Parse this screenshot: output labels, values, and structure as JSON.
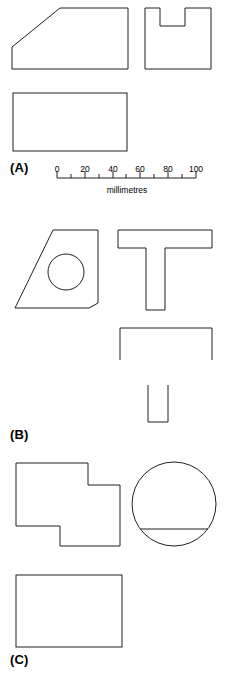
{
  "figure": {
    "background_color": "#ffffff",
    "line_color": "#231f20",
    "line_width": 1
  },
  "groups": [
    {
      "key": "A",
      "label": "(A)",
      "label_position": {
        "x": 10,
        "y": 160
      },
      "views": [
        {
          "name": "wedge-front-view",
          "shape": "polygon",
          "description": "right-angled wedge / ramp block",
          "points": "12,69 12,47 60,8 128,8 128,69"
        },
        {
          "name": "slotted-block-side-view",
          "shape": "polygon",
          "description": "square block with central rectangular slot open at top",
          "points": "145,69 145,8 160,8 160,26 185,26 185,8 211,8 211,69"
        },
        {
          "name": "base-rectangle-plan-view",
          "shape": "rect",
          "description": "plain rectangle plan view",
          "x": 13,
          "y": 93,
          "width": 114,
          "height": 58
        }
      ],
      "scale": {
        "name": "millimetre-scale-bar",
        "caption": "millimetres",
        "caption_position": {
          "x": 127,
          "y": 186
        },
        "axis_y": 178,
        "x_start": 57,
        "x_end": 196,
        "ticks": [
          {
            "value": "0",
            "x": 57
          },
          {
            "value": "20",
            "x": 85
          },
          {
            "value": "40",
            "x": 113
          },
          {
            "value": "60",
            "x": 140
          },
          {
            "value": "80",
            "x": 168
          },
          {
            "value": "100",
            "x": 196
          }
        ],
        "minor_ticks_x": [
          71,
          99,
          126,
          154,
          182
        ],
        "numbers_y": 164
      }
    },
    {
      "key": "B",
      "label": "(B)",
      "label_position": {
        "x": 10,
        "y": 427
      },
      "views": [
        {
          "name": "trapezoid-with-hole-front-view",
          "shape": "polygon",
          "description": "trapezoidal plate with circular hole",
          "points": "15,308 53,230 98,230 98,303 89,308"
        },
        {
          "name": "circular-hole",
          "shape": "circle",
          "description": "circular through hole in trapezoid plate",
          "cx": 66,
          "cy": 272,
          "r": 18
        },
        {
          "name": "tee-section-front-view",
          "shape": "polygon",
          "description": "T-shaped section",
          "points": "118,230 212,230 212,248 165,248 165,310 146,310 146,248 118,248"
        },
        {
          "name": "open-channel-plan-view",
          "shape": "polyline",
          "description": "wide open-ended bracket outline, legs pointing down",
          "points": "120,360 120,328 212,328 212,360"
        },
        {
          "name": "narrow-channel-end-view",
          "shape": "polyline",
          "description": "narrow U channel open at top",
          "points": "148,385 148,422 168,422 168,385"
        }
      ]
    },
    {
      "key": "C",
      "label": "(C)",
      "label_position": {
        "x": 10,
        "y": 652
      },
      "views": [
        {
          "name": "stepped-block-front-view",
          "shape": "polygon",
          "description": "Z-stepped rectangular block outline",
          "points": "16,463 88,463 88,485 120,485 120,546 60,546 60,526 16,526"
        },
        {
          "name": "circle-with-chord-view",
          "shape": "circle",
          "description": "circular view of cylindrical part",
          "cx": 174,
          "cy": 504,
          "r": 42
        },
        {
          "name": "chord-line",
          "shape": "line",
          "description": "horizontal chord across lower part of circle",
          "x1": 140,
          "y1": 529,
          "x2": 208,
          "y2": 529
        },
        {
          "name": "base-rectangle-plan-view",
          "shape": "rect",
          "description": "plain rectangle plan view",
          "x": 16,
          "y": 575,
          "width": 106,
          "height": 72
        }
      ]
    }
  ]
}
